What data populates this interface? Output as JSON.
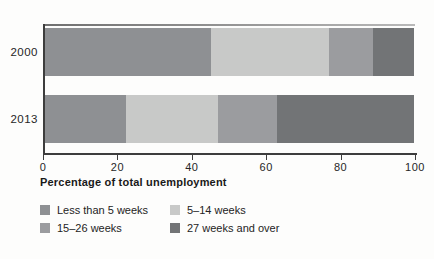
{
  "chart_data": {
    "type": "bar",
    "orientation": "horizontal",
    "stacked": true,
    "categories": [
      "2000",
      "2013"
    ],
    "series": [
      {
        "name": "Less than 5 weeks",
        "color": "#8e9093",
        "values": [
          45,
          22
        ]
      },
      {
        "name": "5–14 weeks",
        "color": "#c8c9c8",
        "values": [
          32,
          25
        ]
      },
      {
        "name": "15–26 weeks",
        "color": "#9b9c9f",
        "values": [
          12,
          16
        ]
      },
      {
        "name": "27 weeks and over",
        "color": "#727476",
        "values": [
          11,
          37
        ]
      }
    ],
    "xlabel": "Percentage of total unemployment",
    "xticks": [
      0,
      20,
      40,
      60,
      80,
      100
    ],
    "xlim": [
      0,
      100
    ],
    "grid": false,
    "legend_position": "bottom-left",
    "axis_color": "#3d3d3d",
    "background_color": "#fdfdfc"
  }
}
